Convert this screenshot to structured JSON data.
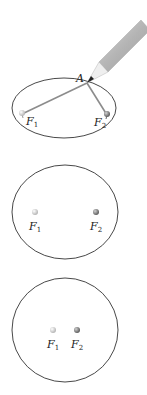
{
  "figure": {
    "panels": [
      {
        "id": "drawing-ellipse",
        "point_label": "A",
        "foci": [
          {
            "name": "F",
            "sub": "1"
          },
          {
            "name": "F",
            "sub": "2"
          }
        ],
        "has_pencil": true
      },
      {
        "id": "ellipse",
        "foci": [
          {
            "name": "F",
            "sub": "1"
          },
          {
            "name": "F",
            "sub": "2"
          }
        ]
      },
      {
        "id": "near-circle",
        "foci": [
          {
            "name": "F",
            "sub": "1"
          },
          {
            "name": "F",
            "sub": "2"
          }
        ]
      }
    ],
    "colors": {
      "outline": "#333333",
      "string": "#8a8a8a",
      "pencil_body": "#b8b8b8",
      "pencil_wood": "#ececec",
      "focus1": "#c8c8c8",
      "focus2": "#7a7a7a"
    }
  }
}
